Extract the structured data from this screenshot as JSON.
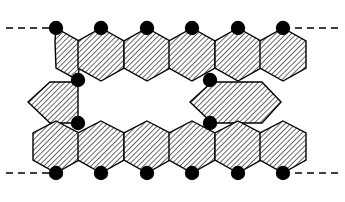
{
  "figure": {
    "width": 345,
    "height": 202,
    "background_color": "#ffffff",
    "stroke_color": "#000000",
    "hatch_color": "#3a3a3a",
    "node_color": "#000000",
    "node_radius": 7.2,
    "hatch_angle_deg": 45,
    "hatch_spacing": 2.6,
    "hatch_line_width": 1.0,
    "shape_stroke_width": 1.4,
    "dashed_line": {
      "label": "polymer continuation bond",
      "dash_pattern": "7 5",
      "stroke_width": 1.6,
      "color": "#000000"
    },
    "nodes": [
      {
        "name": "top-node-1",
        "x": 56,
        "y": 28
      },
      {
        "name": "top-node-2",
        "x": 101,
        "y": 28
      },
      {
        "name": "top-node-3",
        "x": 147,
        "y": 28
      },
      {
        "name": "top-node-4",
        "x": 192,
        "y": 28
      },
      {
        "name": "top-node-5",
        "x": 238,
        "y": 28
      },
      {
        "name": "top-node-6",
        "x": 283,
        "y": 28
      },
      {
        "name": "left-link-node-upper",
        "x": 78,
        "y": 80
      },
      {
        "name": "left-link-node-lower",
        "x": 78,
        "y": 123
      },
      {
        "name": "right-link-node-upper",
        "x": 210,
        "y": 80
      },
      {
        "name": "right-link-node-lower",
        "x": 210,
        "y": 123
      },
      {
        "name": "bottom-node-1",
        "x": 56,
        "y": 173
      },
      {
        "name": "bottom-node-2",
        "x": 101,
        "y": 173
      },
      {
        "name": "bottom-node-3",
        "x": 147,
        "y": 173
      },
      {
        "name": "bottom-node-4",
        "x": 192,
        "y": 173
      },
      {
        "name": "bottom-node-5",
        "x": 238,
        "y": 173
      },
      {
        "name": "bottom-node-6",
        "x": 283,
        "y": 173
      }
    ],
    "dashed_segments": [
      {
        "name": "top-left-dash",
        "x1": 6,
        "y1": 28,
        "x2": 56,
        "y2": 28
      },
      {
        "name": "top-right-dash",
        "x1": 283,
        "y1": 28,
        "x2": 339,
        "y2": 28
      },
      {
        "name": "bottom-left-dash",
        "x1": 6,
        "y1": 173,
        "x2": 56,
        "y2": 173
      },
      {
        "name": "bottom-right-dash",
        "x1": 283,
        "y1": 173,
        "x2": 339,
        "y2": 173
      }
    ],
    "hexagons": [
      {
        "name": "hexagon-top-1",
        "orientation": "vertical",
        "points": "56,28 79,41 79,68 78,80 56,68 55,41"
      },
      {
        "name": "hexagon-top-2",
        "orientation": "vertical",
        "points": "101,28 124,41 124,68 101,81 78,68 78,41"
      },
      {
        "name": "hexagon-top-3",
        "orientation": "vertical",
        "points": "147,28 170,41 170,68 147,81 124,68 124,41"
      },
      {
        "name": "hexagon-top-4",
        "orientation": "vertical",
        "points": "192,28 215,41 215,68 192,81 169,68 169,41"
      },
      {
        "name": "hexagon-top-5",
        "orientation": "vertical",
        "points": "238,28 261,41 261,68 238,81 215,68 215,41"
      },
      {
        "name": "hexagon-top-6",
        "orientation": "vertical",
        "points": "283,28 306,41 306,68 283,81 260,68 260,41"
      },
      {
        "name": "hexagon-middle-left",
        "orientation": "horizontal",
        "points": "28,102 50,82 78,82 78,123 50,123"
      },
      {
        "name": "hexagon-middle-right",
        "orientation": "horizontal",
        "points": "190,102 212,82 262,82 281,102 262,123 212,123"
      },
      {
        "name": "hexagon-bottom-1",
        "orientation": "vertical",
        "points": "56,121 79,133 79,160 56,173 33,160 33,133"
      },
      {
        "name": "hexagon-bottom-2",
        "orientation": "vertical",
        "points": "101,121 124,133 124,160 101,173 78,160 78,133"
      },
      {
        "name": "hexagon-bottom-3",
        "orientation": "vertical",
        "points": "147,121 170,133 170,160 147,173 124,160 124,133"
      },
      {
        "name": "hexagon-bottom-4",
        "orientation": "vertical",
        "points": "192,121 215,133 215,160 192,173 169,160 169,133"
      },
      {
        "name": "hexagon-bottom-5",
        "orientation": "vertical",
        "points": "238,121 261,133 261,160 238,173 215,160 215,133"
      },
      {
        "name": "hexagon-bottom-6",
        "orientation": "vertical",
        "points": "283,121 306,133 306,160 283,173 260,160 260,133"
      }
    ]
  }
}
